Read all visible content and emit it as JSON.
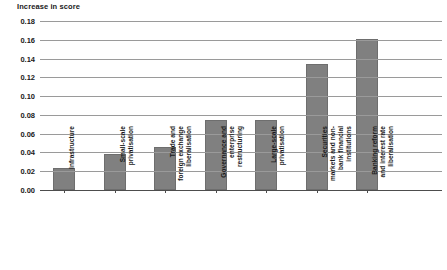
{
  "chart_data": {
    "type": "bar",
    "title": "Increase in score",
    "xlabel": "",
    "ylabel": "Increase in score",
    "ylim": [
      0.0,
      0.18
    ],
    "ytick_step": 0.02,
    "grid": true,
    "legend": false,
    "orientation": "vertical",
    "bar_color": "#808080",
    "categories": [
      "Infrastructure",
      "Small-scale\nprivatisation",
      "Trade and\nforeign exchange\nliberalisation",
      "Governance and\nenterprise\nrestructuring",
      "Large-scale\nprivatisation",
      "Securities\nmarkets and non-\nbank financial\ninstitutions",
      "Banking reform\nand interest rate\nliberalisation"
    ],
    "values": [
      0.023,
      0.038,
      0.046,
      0.075,
      0.075,
      0.134,
      0.161
    ],
    "yticks": [
      "0.00",
      "0.02",
      "0.04",
      "0.06",
      "0.08",
      "0.10",
      "0.12",
      "0.14",
      "0.16",
      "0.18"
    ],
    "ytick_values": [
      0.0,
      0.02,
      0.04,
      0.06,
      0.08,
      0.1,
      0.12,
      0.14,
      0.16,
      0.18
    ]
  },
  "colors": {
    "bar": "#808080",
    "bar_edge": "#6e6e6e",
    "gridline": "#9a9a9a",
    "axis": "#4d4d4d",
    "text": "#1a1a1a"
  }
}
